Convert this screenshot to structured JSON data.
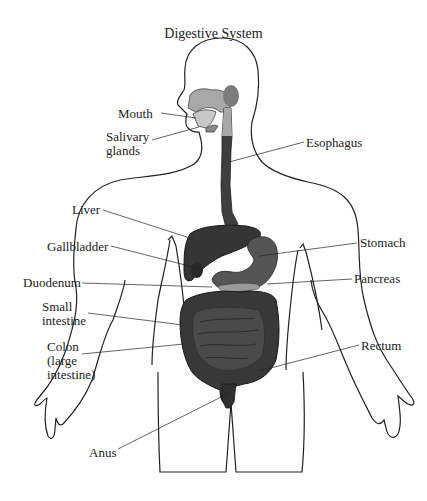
{
  "diagram": {
    "title": "Digestive System",
    "type": "anatomical-illustration",
    "labels": {
      "mouth": "Mouth",
      "salivary_1": "Salivary",
      "salivary_2": "glands",
      "esophagus": "Esophagus",
      "liver": "Liver",
      "gallbladder": "Gallbladder",
      "stomach": "Stomach",
      "duodenum": "Duodenum",
      "pancreas": "Pancreas",
      "small_1": "Small",
      "small_2": "intestine",
      "colon_1": "Colon",
      "colon_2": "(large",
      "colon_3": "intestine)",
      "rectum": "Rectum",
      "anus": "Anus"
    },
    "colors": {
      "outline": "#222222",
      "organ_dark": "#3a3a3a",
      "organ_mid": "#5a5a5a",
      "oral_light": "#a8a8a8",
      "pancreas": "#9a9a9a",
      "background": "#ffffff"
    }
  }
}
